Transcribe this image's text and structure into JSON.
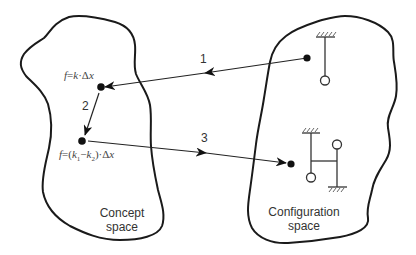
{
  "diagram": {
    "type": "concept-to-configuration mapping",
    "regions": {
      "concept_space": {
        "label_line1": "Concept",
        "label_line2": "space"
      },
      "configuration_space": {
        "label_line1": "Configuration",
        "label_line2": "space"
      }
    },
    "concept_points": {
      "point_a": {
        "formula_prefix": "f",
        "formula_eq": "=",
        "formula_body": "k",
        "formula_op": "·",
        "formula_delta": "Δ",
        "formula_var": "x"
      },
      "point_b": {
        "formula_prefix": "f",
        "formula_eq": "=(",
        "k1": "k",
        "k1_sub": "1",
        "minus": "−",
        "k2": "k",
        "k2_sub": "2",
        "close": ")·",
        "formula_delta": "Δ",
        "formula_var": "x"
      }
    },
    "arrows": [
      {
        "id": "1",
        "label": "1",
        "from": "configuration single pendulum",
        "to": "f=k·Δx"
      },
      {
        "id": "2",
        "label": "2",
        "from": "f=k·Δx",
        "to": "f=(k1−k2)·Δx"
      },
      {
        "id": "3",
        "label": "3",
        "from": "f=(k1−k2)·Δx",
        "to": "configuration coupled pendulums"
      }
    ],
    "configurations": {
      "single_pendulum": {
        "icon": "pendulum-icon"
      },
      "coupled_pendulums": {
        "icon": "coupled-pendulum-icon"
      }
    },
    "colors": {
      "stroke": "#1a1a1a",
      "text": "#333333",
      "background": "#ffffff"
    }
  }
}
